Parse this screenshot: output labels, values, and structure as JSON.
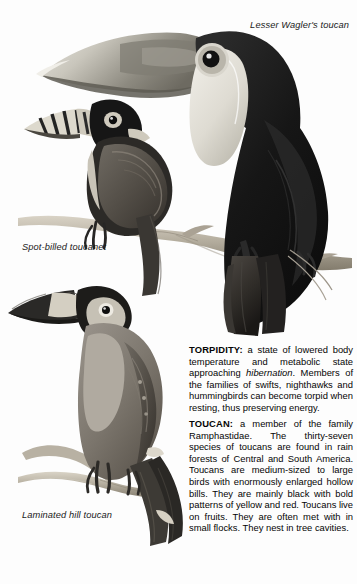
{
  "page": {
    "background_color": "#fdfdfd",
    "text_color": "#050505"
  },
  "illustrations": [
    {
      "id": "lesser-waglers-toucan",
      "caption": "Lesser Wagler's toucan",
      "description": "Large black toucan with huge pale bill, white throat bib and dark eye, perched on a branch",
      "colors": {
        "body": "#141414",
        "bill": "#9a9a93",
        "bib": "#e6e4de",
        "branch": "#b9b2a6"
      }
    },
    {
      "id": "spot-billed-toucanet",
      "caption": "Spot-billed toucanet",
      "description": "Smaller toucanet with banded spotted bill, dark head, grey-olive wings, perched on a branch",
      "colors": {
        "body": "#4c4c4c",
        "head": "#1c1c1c",
        "bill": "#d6d2c6",
        "branch": "#b9b2a6"
      }
    },
    {
      "id": "laminated-hill-toucan",
      "caption": "Laminated hill toucan",
      "description": "Medium toucan with dark wedge bill bearing a pale band, grey body and long dark tail, perched on a forked branch",
      "colors": {
        "body": "#777168",
        "bill": "#2a2a2a",
        "band": "#ddd8cc",
        "branch": "#bdb6a9"
      }
    }
  ],
  "captions": {
    "lesser": "Lesser Wagler's toucan",
    "spot": "Spot-billed toucanet",
    "laminated": "Laminated hill toucan"
  },
  "entries": [
    {
      "term": "TORPIDITY",
      "separator": ":",
      "body_1": " a state of lowered body temperature and metabolic state approaching ",
      "italic": "hibernation",
      "body_2": ". Members of the families of swifts, nighthawks and hummingbirds can become torpid when resting, thus preserving energy."
    },
    {
      "term": "TOUCAN",
      "separator": ":",
      "body_1": " a member of the family Ramphastidae. The thirty-seven species of toucans are found in rain forests of Central and South America. Toucans are medium-sized to large birds with enormously enlarged hollow bills. They are mainly black with bold patterns of yellow and red. Toucans live on fruits. They are often met with in small flocks. They nest in tree cavities.",
      "italic": "",
      "body_2": ""
    }
  ]
}
